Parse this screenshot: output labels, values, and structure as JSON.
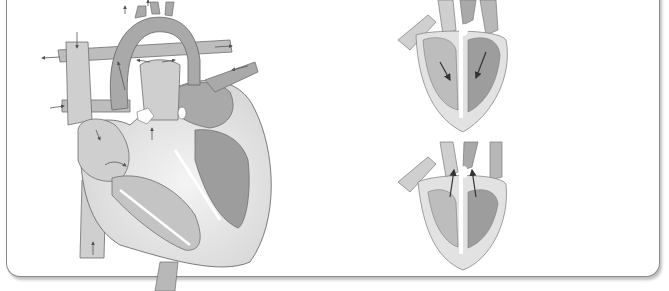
{
  "figure": {
    "main_heart": {
      "name": "heart-cross-section",
      "arrows": 14
    },
    "small_diagrams": [
      {
        "name": "ventricles-filling",
        "arrow_direction": "down"
      },
      {
        "name": "ventricles-contracting",
        "arrow_direction": "up"
      }
    ]
  },
  "colors": {
    "background": "#ffffff",
    "panel_border": "#8a8a8a",
    "vessel_dark": "#a9a9a9",
    "vessel_light": "#cfcfcf",
    "muscle_light": "#e2e2e2",
    "chamber_dark": "#9d9d9d",
    "chamber_mid": "#b8b8b8",
    "outline": "#6e6e6e",
    "arrow": "#505050"
  }
}
